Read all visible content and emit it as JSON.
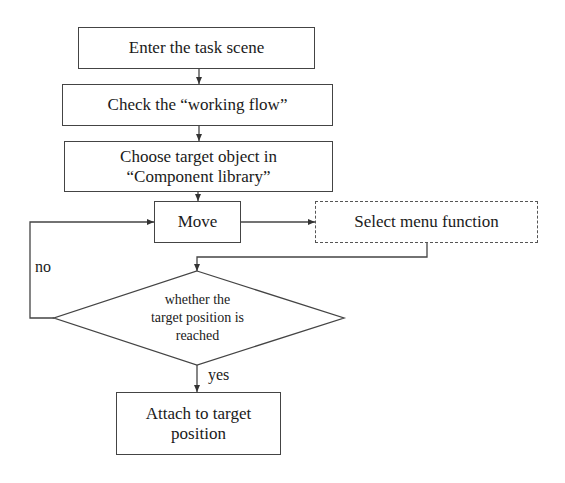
{
  "flowchart": {
    "steps": {
      "enter": "Enter the task scene",
      "check": "Check the “working flow”",
      "choose_line1": "Choose target object in",
      "choose_line2": "“Component library”",
      "move": "Move",
      "select_menu": "Select menu function",
      "decision_line1": "whether the",
      "decision_line2": "target position is",
      "decision_line3": "reached",
      "attach_line1": "Attach to target",
      "attach_line2": "position"
    },
    "edge_labels": {
      "no": "no",
      "yes": "yes"
    },
    "colors": {
      "line": "#444444",
      "background": "#ffffff"
    }
  }
}
